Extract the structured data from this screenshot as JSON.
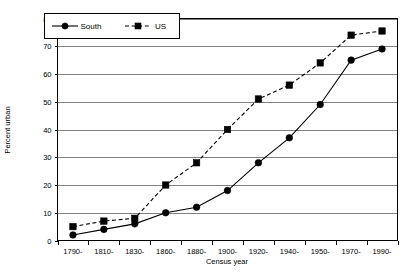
{
  "chart_data": {
    "type": "line",
    "title": "",
    "xlabel": "Census year",
    "ylabel": "Percent urban",
    "categories": [
      "1790-",
      "1810-",
      "1830-",
      "1860-",
      "1880-",
      "1900-",
      "1920-",
      "1940-",
      "1950-",
      "1970-",
      "1990-"
    ],
    "ylim": [
      0,
      80
    ],
    "ytick_step": 10,
    "yticks": [
      "0",
      "10",
      "20",
      "30",
      "40",
      "50",
      "60",
      "70",
      "80"
    ],
    "grid": true,
    "legend_position": "top-left-inside",
    "series": [
      {
        "name": "South",
        "marker": "circle",
        "linestyle": "solid",
        "color": "#000000",
        "values": [
          2,
          4,
          6,
          10,
          12,
          18,
          28,
          37,
          49,
          65,
          69
        ]
      },
      {
        "name": "US",
        "marker": "square",
        "linestyle": "dashed",
        "color": "#000000",
        "values": [
          5,
          7,
          8,
          20,
          28,
          40,
          51,
          56,
          64,
          74,
          75.5
        ]
      }
    ]
  },
  "legend": {
    "items": [
      {
        "label": "South"
      },
      {
        "label": "US"
      }
    ]
  },
  "axes": {
    "y_title": "Percent urban",
    "x_title": "Census year"
  }
}
